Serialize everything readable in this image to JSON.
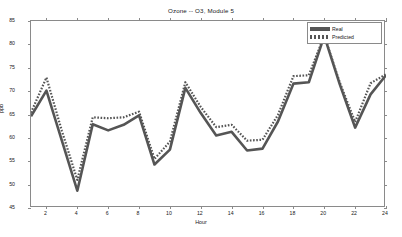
{
  "chart_data": {
    "type": "line",
    "title": "Ozone -- O3, Module 5",
    "xlabel": "Hour",
    "ylabel": "ppb",
    "xlim": [
      1,
      24
    ],
    "ylim": [
      45,
      85
    ],
    "grid": false,
    "legend_position": "top-right",
    "x": [
      1,
      2,
      3,
      4,
      5,
      6,
      7,
      8,
      9,
      10,
      11,
      12,
      13,
      14,
      15,
      16,
      17,
      18,
      19,
      20,
      21,
      22,
      23,
      24
    ],
    "xticks": [
      2,
      4,
      6,
      8,
      10,
      12,
      14,
      16,
      18,
      20,
      22,
      24
    ],
    "yticks": [
      45,
      50,
      55,
      60,
      65,
      70,
      75,
      80,
      85
    ],
    "series": [
      {
        "name": "Real",
        "style": "solid",
        "color": "#555555",
        "values": [
          64.6,
          70.1,
          59.4,
          48.7,
          62.9,
          61.6,
          62.8,
          64.8,
          54.3,
          57.5,
          70.7,
          65.3,
          60.5,
          61.3,
          57.3,
          57.7,
          63.5,
          71.6,
          71.9,
          81.8,
          71.5,
          62.2,
          69.3,
          73.4
        ]
      },
      {
        "name": "Predicted",
        "style": "dashed",
        "color": "#555555",
        "values": [
          65.4,
          72.9,
          61.5,
          51.0,
          64.4,
          64.2,
          64.4,
          65.6,
          55.5,
          59.2,
          71.9,
          66.6,
          62.3,
          62.8,
          59.4,
          59.6,
          64.9,
          73.2,
          73.4,
          81.9,
          71.9,
          63.4,
          71.7,
          73.6
        ]
      }
    ]
  },
  "legend": {
    "items": [
      {
        "label": "Real"
      },
      {
        "label": "Predicted"
      }
    ]
  }
}
